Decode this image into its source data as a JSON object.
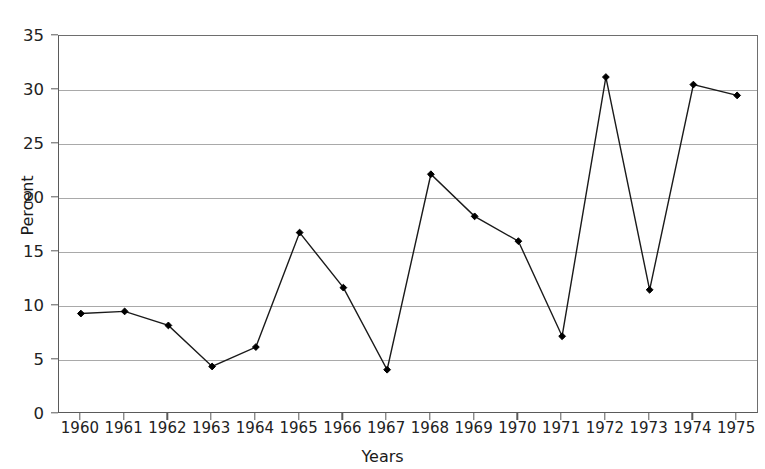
{
  "figure": {
    "title_remnant": "",
    "background_color": "#ffffff"
  },
  "chart_data": {
    "type": "line",
    "title": "",
    "xlabel": "Years",
    "ylabel": "Percent",
    "categories": [
      "1960",
      "1961",
      "1962",
      "1963",
      "1964",
      "1965",
      "1966",
      "1967",
      "1968",
      "1969",
      "1970",
      "1971",
      "1972",
      "1973",
      "1974",
      "1975"
    ],
    "values": [
      9.3,
      9.5,
      8.2,
      4.4,
      6.2,
      16.8,
      11.7,
      4.1,
      22.2,
      18.3,
      16.0,
      7.2,
      31.2,
      11.5,
      30.5,
      29.5
    ],
    "x": [
      1960,
      1961,
      1962,
      1963,
      1964,
      1965,
      1966,
      1967,
      1968,
      1969,
      1970,
      1971,
      1972,
      1973,
      1974,
      1975
    ],
    "xlim": [
      1959.5,
      1975.5
    ],
    "ylim": [
      0,
      35
    ],
    "yticks": [
      0,
      5,
      10,
      15,
      20,
      25,
      30,
      35
    ],
    "ytick_labels": [
      "0",
      "5",
      "10",
      "15",
      "20",
      "25",
      "30",
      "35"
    ],
    "xticks": [
      1960,
      1961,
      1962,
      1963,
      1964,
      1965,
      1966,
      1967,
      1968,
      1969,
      1970,
      1971,
      1972,
      1973,
      1974,
      1975
    ],
    "xtick_labels": [
      "1960",
      "1961",
      "1962",
      "1963",
      "1964",
      "1965",
      "1966",
      "1967",
      "1968",
      "1969",
      "1970",
      "1971",
      "1972",
      "1973",
      "1974",
      "1975"
    ],
    "grid": "horizontal",
    "legend": "none",
    "line_color": "#1a1a1a",
    "marker": "diamond",
    "marker_color": "#000000",
    "grid_color": "#a9a9a9",
    "axis_color": "#5a5a5a"
  }
}
